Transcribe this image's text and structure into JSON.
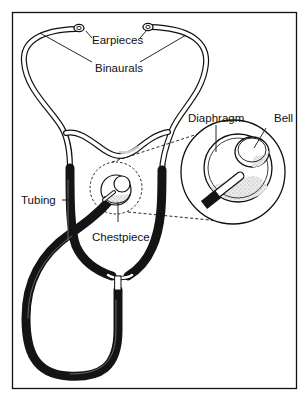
{
  "figure": {
    "labels": {
      "earpieces": "Earpieces",
      "binaurals": "Binaurals",
      "diaphragm": "Diaphragm",
      "bell": "Bell",
      "tubing": "Tubing",
      "chestpiece": "Chestpiece"
    },
    "colors": {
      "ink": "#111111",
      "tubing": "#141414",
      "shading": "#cfcfcf",
      "background": "#ffffff"
    }
  }
}
